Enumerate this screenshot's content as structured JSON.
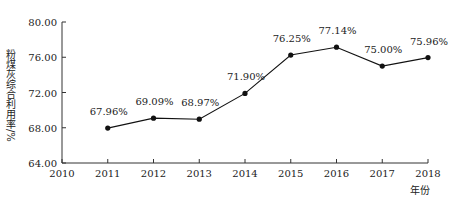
{
  "chart_data": {
    "type": "line",
    "title": "",
    "xlabel": "年份",
    "ylabel": "粉煤灰综合利用率/%",
    "x_ticks": [
      "2010",
      "2011",
      "2012",
      "2013",
      "2014",
      "2015",
      "2016",
      "2017",
      "2018"
    ],
    "y_ticks": [
      "64.00",
      "68.00",
      "72.00",
      "76.00",
      "80.00"
    ],
    "ylim": [
      64,
      80
    ],
    "xlim": [
      2010,
      2018
    ],
    "categories": [
      "2011",
      "2012",
      "2013",
      "2014",
      "2015",
      "2016",
      "2017",
      "2018"
    ],
    "values": [
      67.96,
      69.09,
      68.97,
      71.9,
      76.25,
      77.14,
      75.0,
      75.96
    ],
    "data_labels": [
      "67.96%",
      "69.09%",
      "68.97%",
      "71.90%",
      "76.25%",
      "77.14%",
      "75.00%",
      "75.96%"
    ],
    "grid": false,
    "legend": null,
    "line_color": "#111111",
    "marker": "circle"
  }
}
